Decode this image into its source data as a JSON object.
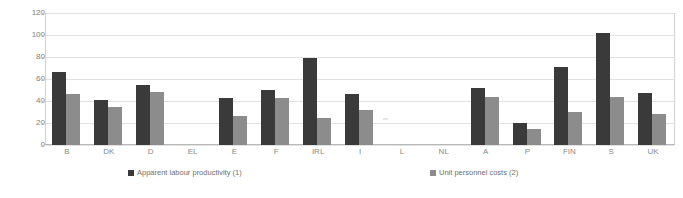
{
  "chart_data": {
    "type": "bar",
    "title": "",
    "subtitle": "",
    "xlabel": "",
    "ylabel": "",
    "ylim": [
      0,
      120
    ],
    "ytick_values": [
      0,
      20,
      40,
      60,
      80,
      100,
      120
    ],
    "ytick_labels": [
      "0",
      "20",
      "40",
      "60",
      "80",
      "100",
      "120"
    ],
    "grid": true,
    "legend_position": "bottom",
    "categories": [
      "B",
      "DK",
      "D",
      "EL",
      "E",
      "F",
      "IRL",
      "I",
      "L",
      "NL",
      "A",
      "P",
      "FIN",
      "S",
      "UK"
    ],
    "series": [
      {
        "name": "Apparent labour productivity (1)",
        "color": "#3a3a3a",
        "values": [
          66,
          41,
          55,
          null,
          43,
          50,
          79,
          46,
          null,
          null,
          52,
          20,
          71,
          102,
          47
        ]
      },
      {
        "name": "Unit personnel costs (2)",
        "color": "#8c8c8c",
        "values": [
          46,
          35,
          48,
          null,
          26,
          43,
          25,
          32,
          null,
          null,
          44,
          15,
          30,
          44,
          28
        ]
      }
    ]
  },
  "legend": {
    "items": [
      {
        "label": "Apparent labour productivity (1)",
        "color": "#3a3a3a"
      },
      {
        "label": "Unit personnel costs (2)",
        "color": "#8c8c8c"
      }
    ]
  },
  "axis": {
    "y_ticks": [
      "120",
      "100",
      "80",
      "60",
      "40",
      "20",
      "0"
    ],
    "x_ticks": [
      "B",
      "DK",
      "D",
      "EL",
      "E",
      "F",
      "IRL",
      "I",
      "L",
      "NL",
      "A",
      "P",
      "FIN",
      "S",
      "UK"
    ]
  },
  "colors": {
    "series1": "#3a3a3a",
    "series2": "#8c8c8c",
    "grid": "#e2e2e2",
    "axis_text": "#808080",
    "background": "#ffffff"
  }
}
